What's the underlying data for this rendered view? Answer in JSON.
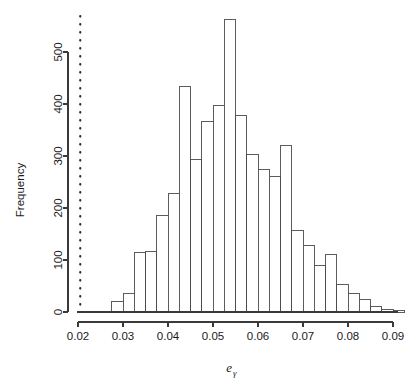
{
  "chart_data": {
    "type": "bar",
    "title": "",
    "subtitle": "",
    "xlabel": "eγ",
    "xlabel_base": "e",
    "xlabel_subscript": "γ",
    "ylabel": "Frequency",
    "xlim": [
      0.0195,
      0.0915
    ],
    "ylim": [
      0,
      575
    ],
    "grid": false,
    "legend": null,
    "bin_width": 0.0025,
    "x_ticks": [
      0.02,
      0.03,
      0.04,
      0.05,
      0.06,
      0.07,
      0.08,
      0.09
    ],
    "x_tick_labels": [
      "0.02",
      "0.03",
      "0.04",
      "0.05",
      "0.06",
      "0.07",
      "0.08",
      "0.09"
    ],
    "y_ticks": [
      0,
      100,
      200,
      300,
      400,
      500
    ],
    "y_tick_labels": [
      "0",
      "100",
      "200",
      "300",
      "400",
      "500"
    ],
    "bin_edges": [
      0.0275,
      0.03,
      0.0325,
      0.035,
      0.0375,
      0.04,
      0.0425,
      0.045,
      0.0475,
      0.05,
      0.0525,
      0.055,
      0.0575,
      0.06,
      0.0625,
      0.065,
      0.0675,
      0.07,
      0.0725,
      0.075,
      0.0775,
      0.08,
      0.0825,
      0.085,
      0.0875,
      0.09,
      0.0925
    ],
    "categories": [
      "0.0275",
      "0.0300",
      "0.0325",
      "0.0350",
      "0.0375",
      "0.0400",
      "0.0425",
      "0.0450",
      "0.0475",
      "0.0500",
      "0.0525",
      "0.0550",
      "0.0575",
      "0.0600",
      "0.0625",
      "0.0650",
      "0.0675",
      "0.0700",
      "0.0725",
      "0.0750",
      "0.0775",
      "0.0800",
      "0.0825",
      "0.0850",
      "0.0875",
      "0.0900"
    ],
    "values": [
      20,
      36,
      114,
      117,
      186,
      227,
      434,
      294,
      366,
      398,
      562,
      378,
      302,
      274,
      261,
      321,
      156,
      128,
      89,
      110,
      53,
      35,
      24,
      11,
      4,
      2
    ],
    "annotations": [
      {
        "name": "reference-line",
        "type": "vline",
        "x": 0.0205,
        "style": "dotted",
        "label": ""
      }
    ]
  },
  "figure": {
    "background_color": "#ffffff",
    "bar_fill_color": "#ffffff",
    "bar_stroke_color": "#4a4a4a",
    "axis_color": "#3a3a3a",
    "reference_line_color": "#2b2b2b"
  }
}
